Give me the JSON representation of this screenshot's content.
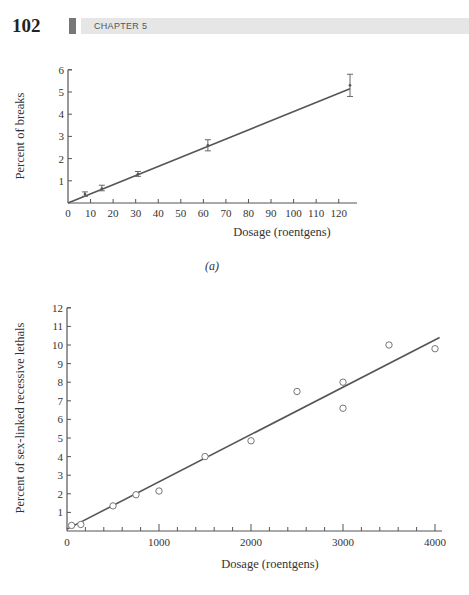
{
  "header": {
    "page_number": "102",
    "chapter": "CHAPTER 5"
  },
  "chart_data": [
    {
      "type": "line",
      "panel_label": "(a)",
      "title": "",
      "xlabel": "Dosage (roentgens)",
      "ylabel": "Percent of breaks",
      "xlim": [
        0,
        125
      ],
      "ylim": [
        0,
        6
      ],
      "xticks": [
        0,
        10,
        20,
        30,
        40,
        50,
        60,
        70,
        80,
        90,
        100,
        110,
        120
      ],
      "yticks": [
        1,
        2,
        3,
        4,
        5,
        6
      ],
      "grid": false,
      "points": [
        {
          "x": 7.5,
          "y": 0.4,
          "err_low": 0.3,
          "err_high": 0.5
        },
        {
          "x": 15,
          "y": 0.65,
          "err_low": 0.55,
          "err_high": 0.8
        },
        {
          "x": 31,
          "y": 1.3,
          "err_low": 1.2,
          "err_high": 1.42
        },
        {
          "x": 62,
          "y": 2.6,
          "err_low": 2.35,
          "err_high": 2.85
        },
        {
          "x": 125,
          "y": 5.3,
          "err_low": 4.8,
          "err_high": 5.8
        }
      ],
      "fit_line": {
        "x": [
          0,
          125
        ],
        "y": [
          0,
          5.15
        ]
      }
    },
    {
      "type": "scatter",
      "title": "",
      "xlabel": "Dosage  (roentgens)",
      "ylabel": "Percent of sex-linked recessive lethals",
      "xlim": [
        0,
        4100
      ],
      "ylim": [
        0,
        12
      ],
      "xticks": [
        0,
        1000,
        2000,
        3000,
        4000
      ],
      "xticklabels": [
        "0",
        "1000",
        "2000",
        "3000",
        "4000"
      ],
      "yticks": [
        1,
        2,
        3,
        4,
        5,
        6,
        7,
        8,
        9,
        10,
        11,
        12
      ],
      "grid": false,
      "points": [
        {
          "x": 50,
          "y": 0.3
        },
        {
          "x": 150,
          "y": 0.35
        },
        {
          "x": 500,
          "y": 1.35
        },
        {
          "x": 750,
          "y": 1.95
        },
        {
          "x": 1000,
          "y": 2.15
        },
        {
          "x": 1500,
          "y": 4.0
        },
        {
          "x": 2000,
          "y": 4.85
        },
        {
          "x": 2500,
          "y": 7.5
        },
        {
          "x": 3000,
          "y": 8.0
        },
        {
          "x": 3000,
          "y": 6.6
        },
        {
          "x": 3500,
          "y": 10.0
        },
        {
          "x": 4000,
          "y": 9.8
        }
      ],
      "fit_line": {
        "x": [
          0,
          4050
        ],
        "y": [
          0.1,
          10.4
        ]
      }
    }
  ]
}
